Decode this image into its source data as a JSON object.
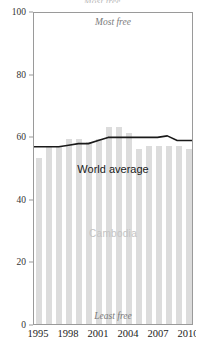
{
  "top_fragment": "Most free",
  "chart_data": {
    "type": "bar",
    "title": "",
    "subtitle": "",
    "xlabel": "",
    "ylabel": "",
    "ylim": [
      0,
      100
    ],
    "xlim": [
      1994.5,
      2010.5
    ],
    "grid": false,
    "legend_position": "inline-annotations",
    "y_ticks": [
      0,
      20,
      40,
      60,
      80,
      100
    ],
    "y_tick_labels": [
      "0",
      "20",
      "40",
      "60",
      "80",
      "100"
    ],
    "x_ticks": [
      1995,
      1998,
      2001,
      2004,
      2007,
      2010
    ],
    "x_tick_labels": [
      "1995",
      "1998",
      "2001",
      "2004",
      "2007",
      "2010"
    ],
    "categories": [
      1995,
      1996,
      1997,
      1998,
      1999,
      2000,
      2001,
      2002,
      2003,
      2004,
      2005,
      2006,
      2007,
      2008,
      2009,
      2010
    ],
    "series": [
      {
        "name": "Cambodia",
        "type": "bar",
        "color": "#dcdcdc",
        "values": [
          53,
          57,
          57,
          59,
          59,
          58,
          59,
          63,
          63,
          61,
          56,
          57,
          57,
          57,
          57,
          56
        ]
      },
      {
        "name": "World average",
        "type": "line",
        "color": "#1a1a1a",
        "values": [
          57,
          57,
          57,
          57.5,
          58,
          58,
          59,
          60,
          60,
          60,
          60,
          60,
          60,
          60.5,
          59,
          59
        ]
      }
    ],
    "annotations": [
      {
        "text": "Most free",
        "position": "top-center",
        "style": "italic"
      },
      {
        "text": "Least free",
        "position": "bottom-center",
        "style": "italic"
      },
      {
        "text": "World average",
        "position": "inside-upper-center"
      },
      {
        "text": "Cambodia",
        "position": "inside-middle-center"
      }
    ]
  },
  "colors": {
    "bar": "#dcdcdc",
    "line": "#1a1a1a",
    "axis": "#9a9a9a",
    "axis_text": "#333333",
    "annotation_muted": "#7a7a7a",
    "annotation_ghost": "#c4c4c4"
  }
}
